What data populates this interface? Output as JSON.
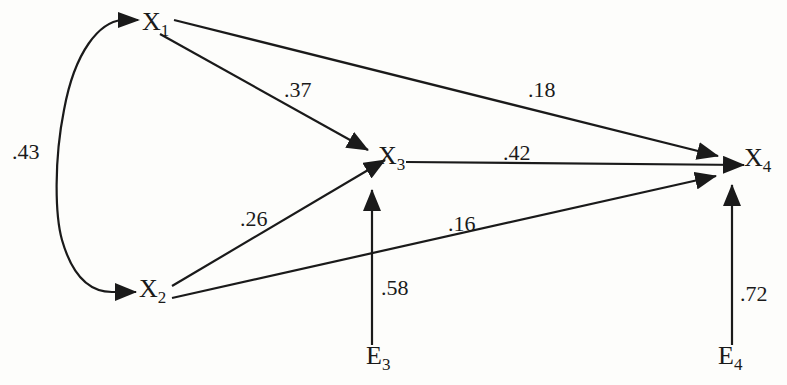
{
  "diagram": {
    "type": "path-diagram",
    "nodes": [
      {
        "id": "X1",
        "label": "X",
        "subscript": "1"
      },
      {
        "id": "X2",
        "label": "X",
        "subscript": "2"
      },
      {
        "id": "X3",
        "label": "X",
        "subscript": "3"
      },
      {
        "id": "X4",
        "label": "X",
        "subscript": "4"
      },
      {
        "id": "E3",
        "label": "E",
        "subscript": "3"
      },
      {
        "id": "E4",
        "label": "E",
        "subscript": "4"
      }
    ],
    "edges": [
      {
        "from": "X1",
        "to": "X2",
        "kind": "correlation",
        "coefficient": ".43"
      },
      {
        "from": "X1",
        "to": "X3",
        "kind": "path",
        "coefficient": ".37"
      },
      {
        "from": "X1",
        "to": "X4",
        "kind": "path",
        "coefficient": ".18"
      },
      {
        "from": "X2",
        "to": "X3",
        "kind": "path",
        "coefficient": ".26"
      },
      {
        "from": "X2",
        "to": "X4",
        "kind": "path",
        "coefficient": ".16"
      },
      {
        "from": "X3",
        "to": "X4",
        "kind": "path",
        "coefficient": ".42"
      },
      {
        "from": "E3",
        "to": "X3",
        "kind": "residual",
        "coefficient": ".58"
      },
      {
        "from": "E4",
        "to": "X4",
        "kind": "residual",
        "coefficient": ".72"
      }
    ],
    "colors": {
      "ink": "#1a1a1a",
      "background": "#fdfdfb"
    }
  }
}
